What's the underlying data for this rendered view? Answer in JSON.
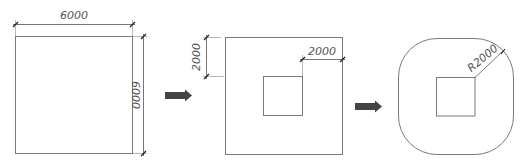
{
  "diagram": {
    "step1": {
      "width_label": "6000",
      "height_label": "6000"
    },
    "step2": {
      "offset_vertical_label": "2000",
      "offset_horizontal_label": "2000"
    },
    "step3": {
      "radius_label": "R2000"
    },
    "arrows": [
      {
        "name": "arrow-step1-to-step2"
      },
      {
        "name": "arrow-step2-to-step3"
      }
    ],
    "colors": {
      "line": "#7a7a7a",
      "dimension": "#555555",
      "arrow": "#444444"
    }
  }
}
